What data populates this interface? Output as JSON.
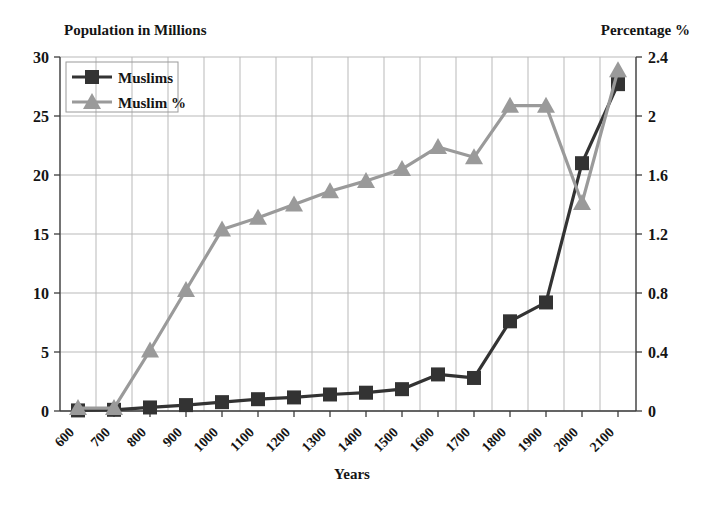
{
  "chart_data": {
    "type": "line",
    "title": "",
    "xlabel": "Years",
    "ylabel": "Population in Millions",
    "y2label": "Percentage %",
    "categories": [
      "600",
      "700",
      "800",
      "900",
      "1000",
      "1100",
      "1200",
      "1300",
      "1400",
      "1500",
      "1600",
      "1700",
      "1800",
      "1900",
      "2000",
      "2100"
    ],
    "ylim": [
      0,
      30
    ],
    "yticks": [
      "0",
      "5",
      "10",
      "15",
      "20",
      "25",
      "30"
    ],
    "y2lim": [
      0,
      2.4
    ],
    "y2ticks": [
      "0",
      "0.4",
      "0.8",
      "1.2",
      "1.6",
      "2",
      "2.4"
    ],
    "grid": true,
    "legend_position": "top-left",
    "series": [
      {
        "name": "Muslims",
        "axis": "left",
        "color": "#333333",
        "marker": "square",
        "values": [
          0.05,
          0.1,
          0.3,
          0.5,
          0.75,
          1.0,
          1.15,
          1.4,
          1.55,
          1.85,
          3.1,
          2.8,
          7.6,
          9.2,
          21.0,
          27.7
        ]
      },
      {
        "name": "Muslim %",
        "axis": "right",
        "color": "#9a9a9a",
        "marker": "triangle",
        "values": [
          0.02,
          0.02,
          0.41,
          0.82,
          1.23,
          1.31,
          1.4,
          1.49,
          1.56,
          1.64,
          1.79,
          1.72,
          2.07,
          2.07,
          1.41,
          2.31
        ]
      }
    ]
  },
  "labels": {
    "left_axis_title": "Population in Millions",
    "right_axis_title": "Percentage %",
    "x_axis_title": "Years"
  }
}
